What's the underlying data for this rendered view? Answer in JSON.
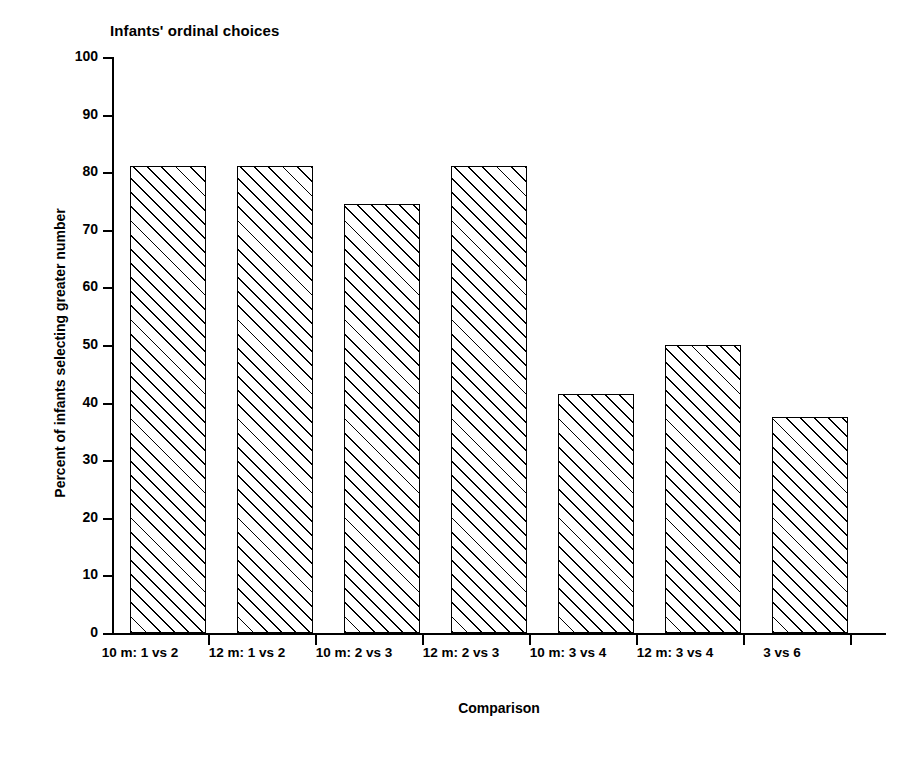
{
  "chart_data": {
    "type": "bar",
    "title": "Infants' ordinal choices",
    "xlabel": "Comparison",
    "ylabel": "Percent of infants selecting greater number",
    "categories": [
      "10 m: 1 vs 2",
      "12 m: 1 vs 2",
      "10 m: 2 vs 3",
      "12 m: 2 vs 3",
      "10 m: 3 vs 4",
      "12 m: 3 vs 4",
      "3 vs 6"
    ],
    "values": [
      81,
      81,
      74.5,
      81,
      41.5,
      50,
      37.5
    ],
    "ylim": [
      0,
      100
    ],
    "yticks": [
      0,
      10,
      20,
      30,
      40,
      50,
      60,
      70,
      80,
      90,
      100
    ],
    "ytick_labels": [
      "0",
      "10",
      "20",
      "30",
      "40",
      "50",
      "60",
      "70",
      "80",
      "90",
      "100"
    ],
    "grid": false,
    "legend": false,
    "bar_style": {
      "fill": "diagonal-hatch",
      "hatch_color": "#000000",
      "face_color": "#ffffff",
      "edge_color": "#000000"
    }
  }
}
